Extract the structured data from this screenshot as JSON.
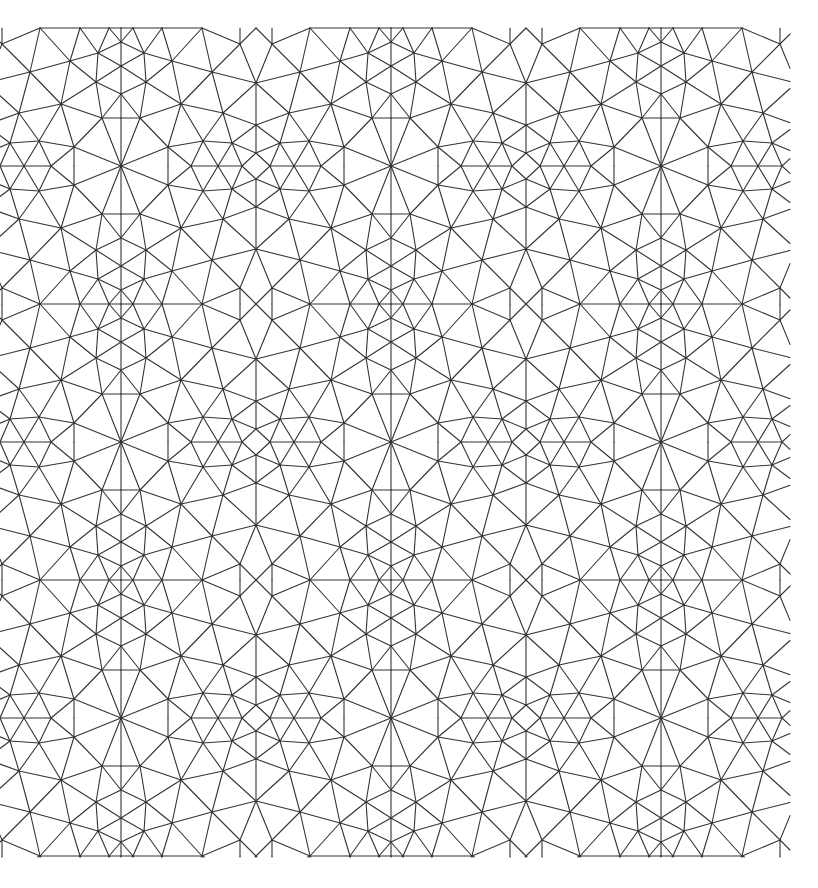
{
  "diagram": {
    "title": "Triangulated mesh",
    "type": "periodic-triangle-mesh",
    "canvas": {
      "width": 818,
      "height": 888,
      "background": "#ffffff"
    },
    "stroke": {
      "color": "#333333",
      "width": 1.1
    },
    "clip": {
      "x0": 0,
      "y0": 28,
      "x1": 790,
      "y1": 857
    },
    "tiling": {
      "x_mirror_origin": 121,
      "x_half_period": 135,
      "y_mirror_origin": 28,
      "y_half_period": 138,
      "x_range": [
        -400,
        1100
      ],
      "y_range": [
        -300,
        1200
      ]
    },
    "vertices": {
      "T1": [
        133,
        28
      ],
      "T2": [
        162,
        28
      ],
      "T3": [
        202,
        28
      ],
      "AP": [
        256,
        28
      ],
      "A": [
        121,
        42
      ],
      "B": [
        144,
        53
      ],
      "C": [
        121,
        66
      ],
      "D": [
        172,
        61
      ],
      "E": [
        212,
        72
      ],
      "F": [
        240,
        44
      ],
      "G": [
        256,
        83
      ],
      "H": [
        146,
        82
      ],
      "I": [
        121,
        94
      ],
      "J": [
        181,
        104
      ],
      "K": [
        140,
        118
      ],
      "L": [
        223,
        113
      ],
      "M": [
        256,
        125
      ],
      "N": [
        203,
        141
      ],
      "O": [
        168,
        147
      ],
      "P": [
        232,
        143
      ],
      "Q": [
        256,
        153
      ],
      "R": [
        121,
        166
      ],
      "S": [
        191,
        166
      ],
      "T": [
        218,
        166
      ],
      "U": [
        242,
        166
      ],
      "KL": [
        121,
        118
      ],
      "OB": [
        168,
        166
      ],
      "FT": [
        240,
        28
      ],
      "AT": [
        121,
        28
      ],
      "XL": [
        109,
        28
      ]
    },
    "edges": [
      [
        "AT",
        "T1"
      ],
      [
        "T1",
        "T2"
      ],
      [
        "T2",
        "T3"
      ],
      [
        "AT",
        "A"
      ],
      [
        "A",
        "C"
      ],
      [
        "C",
        "I"
      ],
      [
        "I",
        "R"
      ],
      [
        "A",
        "T1"
      ],
      [
        "A",
        "B"
      ],
      [
        "T1",
        "B"
      ],
      [
        "B",
        "T2"
      ],
      [
        "B",
        "C"
      ],
      [
        "B",
        "D"
      ],
      [
        "B",
        "H"
      ],
      [
        "C",
        "H"
      ],
      [
        "T2",
        "D"
      ],
      [
        "D",
        "T3"
      ],
      [
        "D",
        "H"
      ],
      [
        "D",
        "E"
      ],
      [
        "D",
        "J"
      ],
      [
        "T3",
        "E"
      ],
      [
        "T3",
        "F"
      ],
      [
        "E",
        "F"
      ],
      [
        "E",
        "G"
      ],
      [
        "E",
        "J"
      ],
      [
        "E",
        "L"
      ],
      [
        "F",
        "FT"
      ],
      [
        "F",
        "AP"
      ],
      [
        "F",
        "G"
      ],
      [
        "G",
        "L"
      ],
      [
        "G",
        "M"
      ],
      [
        "H",
        "I"
      ],
      [
        "H",
        "J"
      ],
      [
        "H",
        "K"
      ],
      [
        "I",
        "K"
      ],
      [
        "K",
        "KL"
      ],
      [
        "K",
        "J"
      ],
      [
        "K",
        "O"
      ],
      [
        "K",
        "R"
      ],
      [
        "J",
        "O"
      ],
      [
        "J",
        "N"
      ],
      [
        "J",
        "L"
      ],
      [
        "L",
        "N"
      ],
      [
        "L",
        "P"
      ],
      [
        "L",
        "M"
      ],
      [
        "M",
        "P"
      ],
      [
        "M",
        "Q"
      ],
      [
        "O",
        "N"
      ],
      [
        "O",
        "OB"
      ],
      [
        "O",
        "R"
      ],
      [
        "O",
        "S"
      ],
      [
        "N",
        "S"
      ],
      [
        "N",
        "T"
      ],
      [
        "N",
        "P"
      ],
      [
        "P",
        "T"
      ],
      [
        "P",
        "U"
      ],
      [
        "P",
        "Q"
      ],
      [
        "Q",
        "U"
      ],
      [
        "S",
        "T"
      ],
      [
        "T",
        "U"
      ],
      [
        "U",
        "Q"
      ]
    ],
    "axis_lines": {
      "vertical_x": [
        121,
        256
      ],
      "notes": "mirror axes of the tiling"
    }
  },
  "chart_data": {
    "type": "diagram",
    "title": "",
    "mirror_lines_x": [
      121,
      256,
      391,
      526,
      661
    ],
    "mirror_lines_y": [
      166,
      304,
      442,
      580,
      718
    ],
    "bounds": {
      "x": [
        0,
        790
      ],
      "y": [
        28,
        857
      ]
    },
    "line_color": "#333333",
    "background": "#ffffff"
  }
}
